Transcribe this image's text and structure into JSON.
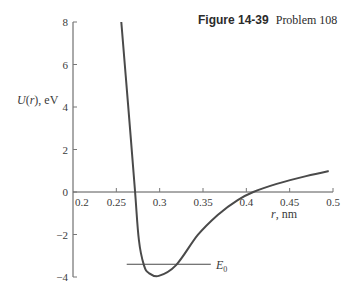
{
  "caption": {
    "figure": "Figure 14-39",
    "problem": "Problem 108"
  },
  "axes": {
    "ylabel": "U(r), eV",
    "xlabel": "r, nm",
    "e0_label": "E",
    "e0_sub": "0"
  },
  "chart_data": {
    "type": "line",
    "title": "Figure 14-39 Problem 108",
    "xlabel": "r, nm",
    "ylabel": "U(r), eV",
    "xlim": [
      0.2,
      0.5
    ],
    "ylim": [
      -4,
      8
    ],
    "xticks": [
      "0.2",
      "0.25",
      "0.3",
      "0.35",
      "0.4",
      "0.45",
      "0.5"
    ],
    "yticks": [
      "-4",
      "-2",
      "0",
      "2",
      "4",
      "6",
      "8"
    ],
    "grid": false,
    "legend": null,
    "series": [
      {
        "name": "U(r)",
        "x": [
          0.2557,
          0.2636,
          0.2716,
          0.276,
          0.2818,
          0.2875,
          0.299,
          0.319,
          0.344,
          0.367,
          0.39,
          0.408,
          0.435,
          0.469,
          0.495
        ],
        "y": [
          8.0,
          4.1,
          0.0,
          -2.26,
          -3.44,
          -3.81,
          -3.95,
          -3.44,
          -2.02,
          -1.08,
          -0.38,
          0.0,
          0.38,
          0.75,
          0.99
        ]
      }
    ],
    "annotations": [
      {
        "label": "E0",
        "type": "hline",
        "y": -3.4,
        "x_from": 0.262,
        "x_to": 0.359
      }
    ]
  }
}
